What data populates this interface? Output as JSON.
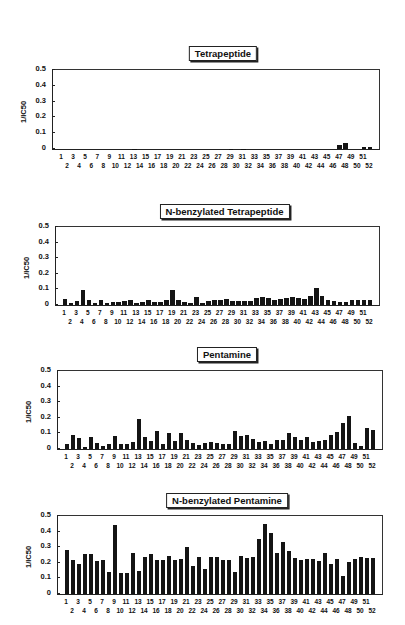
{
  "chart_data": [
    {
      "type": "bar",
      "title": "Tetrapeptide",
      "xlabel": "",
      "ylabel": "1/IC50",
      "ylim": [
        0,
        0.5
      ],
      "yticks": [
        "0",
        "0.1",
        "0.2",
        "0.3",
        "0.4",
        "0.5"
      ],
      "grid": false,
      "categories": [
        "1",
        "2",
        "3",
        "4",
        "5",
        "6",
        "7",
        "8",
        "9",
        "10",
        "11",
        "12",
        "13",
        "14",
        "15",
        "16",
        "17",
        "18",
        "19",
        "20",
        "21",
        "22",
        "23",
        "24",
        "25",
        "26",
        "27",
        "28",
        "29",
        "30",
        "31",
        "32",
        "33",
        "34",
        "35",
        "36",
        "37",
        "38",
        "39",
        "40",
        "41",
        "42",
        "43",
        "44",
        "45",
        "46",
        "47",
        "48",
        "49",
        "50",
        "51",
        "52"
      ],
      "values": [
        0,
        0,
        0,
        0,
        0,
        0,
        0,
        0,
        0,
        0,
        0,
        0,
        0.003,
        0,
        0,
        0,
        0,
        0,
        0,
        0,
        0,
        0,
        0,
        0,
        0,
        0,
        0,
        0,
        0.003,
        0,
        0.003,
        0,
        0,
        0,
        0,
        0,
        0,
        0,
        0,
        0,
        0,
        0,
        0,
        0,
        0,
        0,
        0.025,
        0.035,
        0,
        0,
        0.01,
        0.01
      ]
    },
    {
      "type": "bar",
      "title": "N-benzylated Tetrapeptide",
      "xlabel": "",
      "ylabel": "1/IC50",
      "ylim": [
        0,
        0.5
      ],
      "yticks": [
        "0",
        "0.1",
        "0.2",
        "0.3",
        "0.4",
        "0.5"
      ],
      "grid": false,
      "categories": [
        "1",
        "2",
        "3",
        "4",
        "5",
        "6",
        "7",
        "8",
        "9",
        "10",
        "11",
        "12",
        "13",
        "14",
        "15",
        "16",
        "17",
        "18",
        "19",
        "20",
        "21",
        "22",
        "23",
        "24",
        "25",
        "26",
        "27",
        "28",
        "29",
        "30",
        "31",
        "32",
        "33",
        "34",
        "35",
        "36",
        "37",
        "38",
        "39",
        "40",
        "41",
        "42",
        "43",
        "44",
        "45",
        "46",
        "47",
        "48",
        "49",
        "50",
        "51",
        "52"
      ],
      "values": [
        0.04,
        0.015,
        0.025,
        0.095,
        0.03,
        0.01,
        0.035,
        0.015,
        0.02,
        0.02,
        0.025,
        0.03,
        0.015,
        0.02,
        0.03,
        0.02,
        0.02,
        0.03,
        0.095,
        0.035,
        0.02,
        0.01,
        0.05,
        0.015,
        0.025,
        0.035,
        0.03,
        0.04,
        0.025,
        0.025,
        0.025,
        0.025,
        0.045,
        0.05,
        0.045,
        0.035,
        0.04,
        0.045,
        0.05,
        0.045,
        0.04,
        0.06,
        0.11,
        0.055,
        0.03,
        0.025,
        0.02,
        0.02,
        0.03,
        0.035,
        0.03,
        0.03
      ]
    },
    {
      "type": "bar",
      "title": "Pentamine",
      "xlabel": "",
      "ylabel": "1/IC50",
      "ylim": [
        0,
        0.5
      ],
      "yticks": [
        "0",
        "0.1",
        "0.2",
        "0.3",
        "0.4",
        "0.5"
      ],
      "grid": false,
      "categories": [
        "1",
        "2",
        "3",
        "4",
        "5",
        "6",
        "7",
        "8",
        "9",
        "10",
        "11",
        "12",
        "13",
        "14",
        "15",
        "16",
        "17",
        "18",
        "19",
        "20",
        "21",
        "22",
        "23",
        "24",
        "25",
        "26",
        "27",
        "28",
        "29",
        "30",
        "31",
        "32",
        "33",
        "34",
        "35",
        "36",
        "37",
        "38",
        "39",
        "40",
        "41",
        "42",
        "43",
        "44",
        "45",
        "46",
        "47",
        "48",
        "49",
        "50",
        "51",
        "52"
      ],
      "values": [
        0.03,
        0.09,
        0.07,
        0.015,
        0.075,
        0.04,
        0.02,
        0.035,
        0.085,
        0.035,
        0.035,
        0.045,
        0.19,
        0.075,
        0.05,
        0.115,
        0.03,
        0.105,
        0.05,
        0.1,
        0.055,
        0.04,
        0.025,
        0.04,
        0.045,
        0.04,
        0.03,
        0.03,
        0.115,
        0.085,
        0.09,
        0.065,
        0.045,
        0.05,
        0.03,
        0.06,
        0.06,
        0.1,
        0.075,
        0.06,
        0.08,
        0.045,
        0.05,
        0.06,
        0.09,
        0.11,
        0.165,
        0.21,
        0.04,
        0.02,
        0.135,
        0.12
      ]
    },
    {
      "type": "bar",
      "title": "N-benzylated Pentamine",
      "xlabel": "",
      "ylabel": "1/IC50",
      "ylim": [
        0,
        0.5
      ],
      "yticks": [
        "0",
        "0.1",
        "0.2",
        "0.3",
        "0.4",
        "0.5"
      ],
      "grid": false,
      "categories": [
        "1",
        "2",
        "3",
        "4",
        "5",
        "6",
        "7",
        "8",
        "9",
        "10",
        "11",
        "12",
        "13",
        "14",
        "15",
        "16",
        "17",
        "18",
        "19",
        "20",
        "21",
        "22",
        "23",
        "24",
        "25",
        "26",
        "27",
        "28",
        "29",
        "30",
        "31",
        "32",
        "33",
        "34",
        "35",
        "36",
        "37",
        "38",
        "39",
        "40",
        "41",
        "42",
        "43",
        "44",
        "45",
        "46",
        "47",
        "48",
        "49",
        "50",
        "51",
        "52"
      ],
      "values": [
        0.28,
        0.215,
        0.195,
        0.255,
        0.255,
        0.21,
        0.22,
        0.14,
        0.44,
        0.135,
        0.135,
        0.265,
        0.15,
        0.24,
        0.255,
        0.215,
        0.215,
        0.245,
        0.22,
        0.225,
        0.3,
        0.18,
        0.235,
        0.16,
        0.24,
        0.24,
        0.215,
        0.22,
        0.14,
        0.245,
        0.23,
        0.24,
        0.35,
        0.45,
        0.39,
        0.26,
        0.335,
        0.275,
        0.23,
        0.215,
        0.225,
        0.225,
        0.21,
        0.26,
        0.195,
        0.225,
        0.115,
        0.205,
        0.225,
        0.235,
        0.23,
        0.23
      ]
    }
  ],
  "layout": [
    {
      "top": 69,
      "left": 52,
      "right": 378,
      "height": 79,
      "title_y": 46
    },
    {
      "top": 226,
      "left": 55,
      "right": 378,
      "height": 78,
      "title_y": 204
    },
    {
      "top": 370,
      "left": 57,
      "right": 381,
      "height": 78,
      "title_y": 347
    },
    {
      "top": 515,
      "left": 57,
      "right": 381,
      "height": 78,
      "title_y": 493
    }
  ]
}
